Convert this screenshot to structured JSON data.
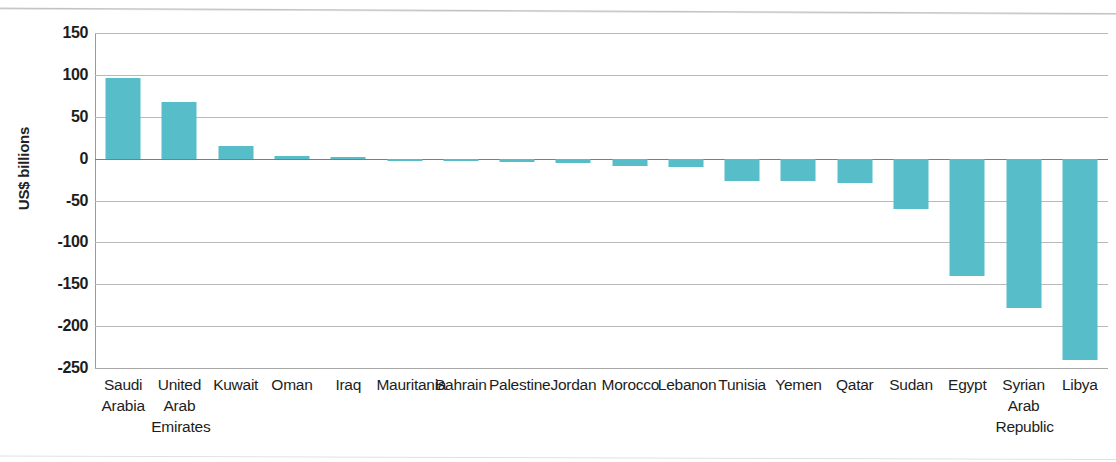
{
  "chart_data": {
    "type": "bar",
    "title": "",
    "subtitle": "",
    "xlabel": "",
    "ylabel": "US$ billions",
    "ylim": [
      -250,
      150
    ],
    "ytick_values": [
      150,
      100,
      50,
      0,
      -50,
      -100,
      -150,
      -200,
      -250
    ],
    "ytick_labels": [
      "150",
      "100",
      "50",
      "0",
      "-50",
      "-100",
      "-150",
      "-200",
      "-250"
    ],
    "grid": true,
    "legend": null,
    "legend_position": "none",
    "bar_color": "#56bdc9",
    "gridline_color": "#b9b9b9",
    "axis_color": "#7d7d7d",
    "categories": [
      "Saudi Arabia",
      "United Arab Emirates",
      "Kuwait",
      "Oman",
      "Iraq",
      "Mauritania",
      "Bahrain",
      "Palestine",
      "Jordan",
      "Morocco",
      "Lebanon",
      "Tunisia",
      "Yemen",
      "Qatar",
      "Sudan",
      "Egypt",
      "Syrian Arab Republic",
      "Libya"
    ],
    "category_label_lines": [
      [
        "Saudi",
        "Arabia"
      ],
      [
        "United",
        "Arab",
        "Emirates"
      ],
      [
        "Kuwait"
      ],
      [
        "Oman"
      ],
      [
        "Iraq"
      ],
      [
        "Mauritania"
      ],
      [
        "Bahrain"
      ],
      [
        "Palestine"
      ],
      [
        "Jordan"
      ],
      [
        "Morocco"
      ],
      [
        "Lebanon"
      ],
      [
        "Tunisia"
      ],
      [
        "Yemen"
      ],
      [
        "Qatar"
      ],
      [
        "Sudan"
      ],
      [
        "Egypt"
      ],
      [
        "Syrian",
        "Arab",
        "Republic"
      ],
      [
        "Libya"
      ]
    ],
    "values": [
      96,
      68,
      15,
      3,
      2,
      -2,
      -2,
      -4,
      -5,
      -9,
      -10,
      -27,
      -27,
      -29,
      -60,
      -140,
      -178,
      -240
    ]
  }
}
